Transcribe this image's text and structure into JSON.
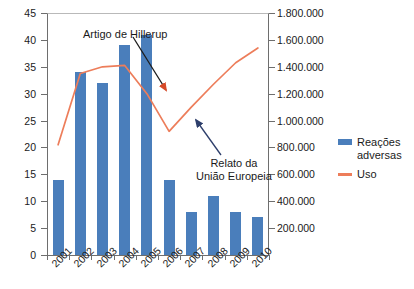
{
  "chart_data": {
    "type": "bar",
    "title": "",
    "xlabel": "",
    "ylabel": "",
    "categories": [
      "2001",
      "2002",
      "2003",
      "2004",
      "2005",
      "2006",
      "2007",
      "2008",
      "2009",
      "2010"
    ],
    "grid": false,
    "legend_position": "right",
    "series": [
      {
        "name": "Reações adversas",
        "type": "bar",
        "axis": "left",
        "color": "#4a7ebb",
        "values": [
          14,
          34,
          32,
          39,
          41,
          14,
          8,
          11,
          8,
          7
        ]
      },
      {
        "name": "Uso",
        "type": "line",
        "axis": "right",
        "color": "#ed7d5a",
        "values": [
          820000,
          1350000,
          1400000,
          1410000,
          1200000,
          920000,
          1100000,
          1270000,
          1430000,
          1540000
        ]
      }
    ],
    "left_axis": {
      "ylim": [
        0,
        45
      ],
      "ticks": [
        0,
        5,
        10,
        15,
        20,
        25,
        30,
        35,
        40,
        45
      ],
      "tick_labels": [
        "0",
        "5",
        "10",
        "15",
        "20",
        "25",
        "30",
        "35",
        "40",
        "45"
      ]
    },
    "right_axis": {
      "ylim": [
        0,
        1800000
      ],
      "ticks": [
        200000,
        400000,
        600000,
        800000,
        1000000,
        1200000,
        1400000,
        1600000,
        1800000
      ],
      "tick_labels": [
        "200.000",
        "400.000",
        "600.000",
        "800.000",
        "1.000.000",
        "1.200.000",
        "1.400.000",
        "1.600.000",
        "1.800.000"
      ]
    },
    "annotations": [
      {
        "id": "hillerup",
        "text": "Artigo de Hillerup",
        "arrow_color": "#1c1c1c",
        "points_to": "2006"
      },
      {
        "id": "eu-report",
        "line1": "Relato da",
        "line2": "União Europeia",
        "text": "Relato da União Europeia",
        "arrow_color": "#2d3e6b",
        "points_to": "2006"
      }
    ]
  },
  "legend": {
    "items": [
      {
        "label": "Reações\nadversas",
        "type": "bar",
        "color": "#4a7ebb"
      },
      {
        "label": "Uso",
        "type": "line",
        "color": "#ed7d5a"
      }
    ]
  }
}
